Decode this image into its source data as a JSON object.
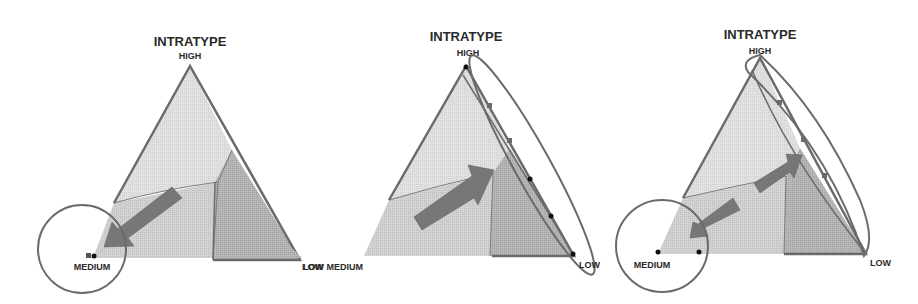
{
  "figure": {
    "panels": [
      {
        "title": "INTRATYPE",
        "labels": {
          "top": "HIGH",
          "left": "MEDIUM",
          "right": "LOW"
        },
        "highlight": "circle around MEDIUM vertex",
        "arrow": "toward MEDIUM"
      },
      {
        "title": "INTRATYPE",
        "labels": {
          "top": "HIGH",
          "left": "LOW MEDIUM",
          "right": "LOW"
        },
        "highlight": "ellipse along HIGH–LOW edge",
        "arrow": "toward HIGH–LOW edge"
      },
      {
        "title": "INTRATYPE",
        "labels": {
          "top": "HIGH",
          "left": "MEDIUM",
          "right": "LOW"
        },
        "highlight": "circle around MEDIUM vertex and ellipse along HIGH–LOW edge",
        "arrow": "two arrows: toward HIGH–LOW edge and toward MEDIUM"
      }
    ]
  },
  "colors": {
    "outline": "#6b6b6b",
    "region_light": "#e4e4e4",
    "region_mid": "#d6d6d6",
    "region_dark": "#b4b4b4",
    "arrow": "#777777",
    "point": "#111111",
    "text": "#2a2a2a"
  }
}
